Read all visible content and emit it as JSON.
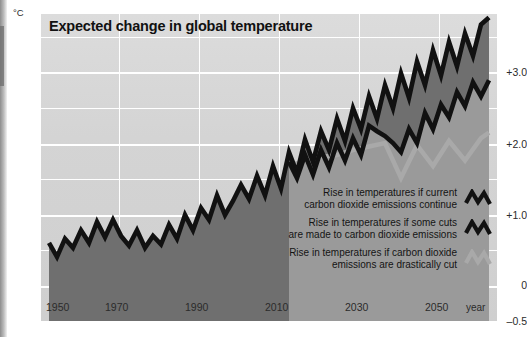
{
  "chart_data": {
    "type": "line",
    "title": "Expected change in global temperature",
    "xlabel": "year",
    "ylabel": "°C",
    "unit": "°C",
    "xlim": [
      1948,
      2062
    ],
    "ylim": [
      -0.5,
      3.9
    ],
    "grid": true,
    "y_ticks": [
      "+3.0",
      "+2.0",
      "+1.0",
      "0",
      "–0.5"
    ],
    "y_tick_values": [
      3.0,
      2.0,
      1.0,
      0,
      -0.5
    ],
    "y_minor_gridlines": [
      3.5,
      2.5,
      1.5,
      0.5
    ],
    "x_ticks": [
      "1950",
      "1970",
      "1990",
      "2010",
      "2030",
      "2050"
    ],
    "x_tick_values": [
      1950,
      1970,
      1990,
      2010,
      2030,
      2050
    ],
    "legend_position": "inside-bottom-right",
    "colors": {
      "background": "#d6d6d6",
      "band_low": "#9a9a9a",
      "band_mid": "#6f6f6f",
      "line_dark": "#111111",
      "line_light": "#a9a9a9",
      "gridline": "#ffffff",
      "text": "#1c1c1c"
    },
    "series": [
      {
        "name": "Rise in temperatures if current carbon dioxide emissions continue",
        "style": "dark-zigzag",
        "x": [
          1950,
          1952,
          1954,
          1956,
          1958,
          1960,
          1962,
          1964,
          1966,
          1968,
          1970,
          1972,
          1974,
          1976,
          1978,
          1980,
          1982,
          1984,
          1986,
          1988,
          1990,
          1992,
          1994,
          1996,
          1998,
          2000,
          2002,
          2004,
          2006,
          2008,
          2010,
          2012,
          2014,
          2016,
          2018,
          2020,
          2022,
          2024,
          2026,
          2028,
          2030,
          2032,
          2034,
          2036,
          2038,
          2040,
          2042,
          2044,
          2046,
          2048,
          2050,
          2052,
          2054,
          2056,
          2058,
          2060
        ],
        "values": [
          0.62,
          0.42,
          0.68,
          0.55,
          0.8,
          0.62,
          0.92,
          0.7,
          0.95,
          0.72,
          0.58,
          0.8,
          0.55,
          0.72,
          0.6,
          0.88,
          0.68,
          1.02,
          0.8,
          1.12,
          0.95,
          1.3,
          1.02,
          1.22,
          1.45,
          1.25,
          1.58,
          1.3,
          1.72,
          1.4,
          1.92,
          1.62,
          2.1,
          1.78,
          2.22,
          1.95,
          2.4,
          2.08,
          2.55,
          2.25,
          2.72,
          2.4,
          2.88,
          2.55,
          3.05,
          2.7,
          3.22,
          2.88,
          3.38,
          3.02,
          3.5,
          3.15,
          3.62,
          3.3,
          3.75,
          3.85
        ]
      },
      {
        "name": "Rise in temperatures if some cuts are made to carbon dioxide emissions",
        "style": "dark-zigzag",
        "x": [
          2010,
          2012,
          2014,
          2016,
          2018,
          2020,
          2022,
          2024,
          2026,
          2028,
          2030,
          2032,
          2034,
          2036,
          2038,
          2040,
          2042,
          2044,
          2046,
          2048,
          2050,
          2052,
          2054,
          2056,
          2058,
          2060
        ],
        "values": [
          1.78,
          1.55,
          1.88,
          1.6,
          1.95,
          1.7,
          2.05,
          1.8,
          2.12,
          1.88,
          2.3,
          2.22,
          2.15,
          2.05,
          1.92,
          2.25,
          2.05,
          2.48,
          2.25,
          2.6,
          2.42,
          2.78,
          2.58,
          2.92,
          2.72,
          2.95
        ]
      },
      {
        "name": "Rise in temperatures if carbon dioxide emissions are drastically cut",
        "style": "light-zigzag",
        "x": [
          2010,
          2014,
          2018,
          2022,
          2026,
          2030,
          2034,
          2038,
          2042,
          2046,
          2050,
          2054,
          2058,
          2060
        ],
        "values": [
          1.72,
          1.8,
          1.85,
          1.88,
          1.95,
          2.0,
          2.05,
          1.55,
          2.02,
          1.72,
          2.08,
          1.8,
          2.12,
          2.2
        ]
      }
    ],
    "annotations": []
  },
  "legend": {
    "items": [
      {
        "label": "Rise in temperatures if current carbon dioxide emissions continue",
        "line1": "Rise in temperatures if current",
        "line2": "carbon dioxide emissions continue",
        "glyph": "zigzag-icon-dark",
        "color": "#111111"
      },
      {
        "label": "Rise in temperatures if some cuts are made to carbon dioxide emissions",
        "line1": "Rise in temperatures if some cuts",
        "line2": "are made to carbon dioxide emissions",
        "glyph": "zigzag-icon-dark",
        "color": "#111111"
      },
      {
        "label": "Rise in temperatures if carbon dioxide emissions are drastically cut",
        "line1": "Rise in temperatures if carbon dioxide",
        "line2": "emissions are drastically cut",
        "glyph": "zigzag-icon-light",
        "color": "#a9a9a9"
      }
    ]
  }
}
